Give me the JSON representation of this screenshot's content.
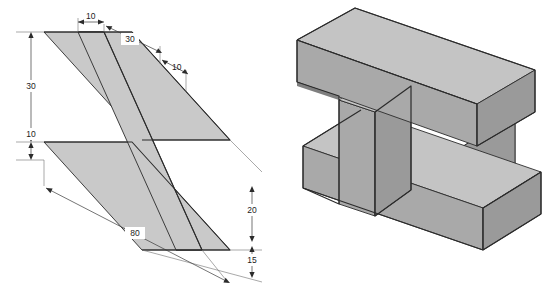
{
  "figure": {
    "panels": [
      {
        "name": "orthographic-oblique-view",
        "label": "Dimensioned oblique view of I-section"
      },
      {
        "name": "isometric-pictorial-view",
        "label": "Shaded isometric pictorial of I-beam block"
      }
    ]
  },
  "dimensions": {
    "top": [
      {
        "id": "top-left-flange-thickness",
        "value": "10"
      },
      {
        "id": "top-web-span",
        "value": "30"
      },
      {
        "id": "top-right-flange-thickness",
        "value": "10"
      }
    ],
    "left": [
      {
        "id": "left-upper-height",
        "value": "30"
      },
      {
        "id": "left-lower-height",
        "value": "10"
      }
    ],
    "right": [
      {
        "id": "right-upper-depth",
        "value": "20"
      },
      {
        "id": "right-lower-depth",
        "value": "15"
      }
    ],
    "bottom": [
      {
        "id": "overall-length",
        "value": "80"
      }
    ]
  },
  "colors": {
    "outline": "#2b2b2b",
    "thin_line": "#6f6f6f",
    "section_fill": "#c9c9c9",
    "face_top": "#c4c4c4",
    "face_front": "#a9a9a9",
    "face_side": "#9a9a9a",
    "face_cavity_back": "#8f8f8f",
    "face_cavity_floor": "#d2d2d2",
    "background": "#ffffff",
    "text": "#1c1c1c"
  }
}
